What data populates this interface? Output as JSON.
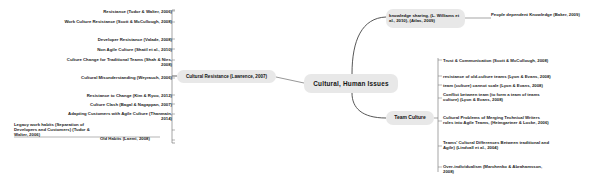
{
  "diagram": {
    "title": "Cultural, Human Issues",
    "type": "mind-map",
    "center_node": {
      "label": "Cultural, Human Issues"
    },
    "branches": [
      {
        "id": "cultural-resistance",
        "label": "Cultural Resistance (Lawrence, 2007)",
        "side": "left",
        "leaves": [
          "Resistance  (Tudor & Walter, 2006)",
          "Work Culture Resistance (Scott & McCullough, 2008)",
          "Developer Resistance (Valade, 2008)",
          "Non Agile Culture (Shatil et al., 2010)",
          "Culture Change for Traditional Teams (Shah & Nies, 2008)",
          "Cultural Misunderstanding (Weyrauch, 2006)",
          "Resistance to Change (Kim & Ryoo, 2012)",
          "Culture Clash (Bagal & Nagappan, 2007)",
          "Adapting Customers with Agile Culture (Thanmain, 2014)",
          "Legacy work habits (Separation of Developers and Customers) (Tudor & Walter, 2006)",
          "Old Habits (Laemi, 2008)"
        ]
      },
      {
        "id": "knowledge-sharing",
        "label": "knowledge sharing, (L. Williams et al., 2010), (Atlas, 2009)",
        "side": "right-top",
        "leaves": [
          "People dependent Knowledge (Baker, 2009)"
        ]
      },
      {
        "id": "team-culture",
        "label": "Team Culture",
        "side": "right-bottom",
        "leaves": [
          "Trust & Communication (Scott & McCullough, 2008)",
          "resistance of old-culture teams (Lyon & Evans, 2008)",
          "team (culture) cannot scale (Lyon & Evans, 2008)",
          "Conflict between team (to form a team of teams culture) (Lyon & Evans, 2008)",
          "Cultural Problems of Merging Technical Writers roles into Agile Teams, (Heimgartner & Locke, 2006)",
          "Teams' Cultural Differences Between traditional and Agile) (Lindvall et al., 2004)",
          "Over-individualism (Marchenko & Abrahamsson, 2008)"
        ]
      }
    ],
    "colors": {
      "node_fill": "#e8e8e8",
      "text": "#1a1a1a",
      "connector": "#555555",
      "background": "#ffffff"
    }
  }
}
